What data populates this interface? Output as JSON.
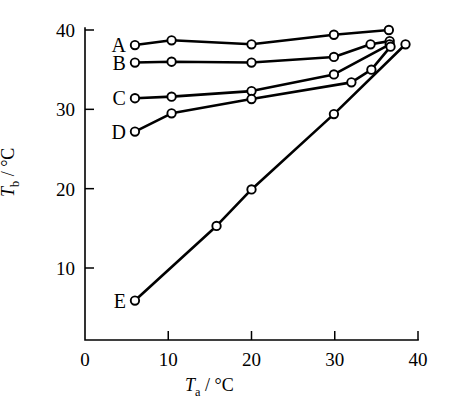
{
  "chart_data": {
    "type": "line",
    "title": "",
    "xlabel": "Ta / °C",
    "ylabel": "Tb / °C",
    "xlim": [
      0,
      40
    ],
    "ylim": [
      0,
      40
    ],
    "xticks": [
      0,
      10,
      20,
      30,
      40
    ],
    "yticks": [
      10,
      20,
      30,
      40
    ],
    "grid": false,
    "legend_position": "inline-left-labels",
    "marker": "open-circle",
    "series": [
      {
        "name": "A",
        "label": "A",
        "points": [
          [
            6.0,
            38.1
          ],
          [
            10.4,
            38.7
          ],
          [
            20.0,
            38.2
          ],
          [
            29.9,
            39.4
          ],
          [
            36.5,
            40.0
          ]
        ]
      },
      {
        "name": "B",
        "label": "B",
        "points": [
          [
            6.0,
            35.9
          ],
          [
            10.4,
            36.0
          ],
          [
            20.0,
            35.9
          ],
          [
            29.9,
            36.6
          ],
          [
            34.3,
            38.2
          ],
          [
            36.6,
            38.6
          ]
        ]
      },
      {
        "name": "C",
        "label": "C",
        "points": [
          [
            6.0,
            31.4
          ],
          [
            10.4,
            31.6
          ],
          [
            20.0,
            32.3
          ],
          [
            29.9,
            34.4
          ],
          [
            36.6,
            38.2
          ]
        ]
      },
      {
        "name": "D",
        "label": "D",
        "points": [
          [
            6.0,
            27.2
          ],
          [
            10.4,
            29.5
          ],
          [
            20.0,
            31.3
          ],
          [
            32.0,
            33.4
          ],
          [
            34.4,
            35.0
          ],
          [
            36.7,
            37.9
          ]
        ]
      },
      {
        "name": "E",
        "label": "E",
        "points": [
          [
            6.0,
            5.9
          ],
          [
            15.8,
            15.3
          ],
          [
            20.0,
            19.9
          ],
          [
            29.9,
            29.4
          ],
          [
            38.5,
            38.2
          ]
        ]
      }
    ]
  },
  "axes": {
    "x_title_main": "T",
    "x_title_sub": "a",
    "x_title_unit": " / °C",
    "y_title_main": "T",
    "y_title_sub": "b",
    "y_title_unit": " / °C",
    "xtick_labels": [
      "0",
      "10",
      "20",
      "30",
      "40"
    ],
    "ytick_labels": [
      "10",
      "20",
      "30",
      "40"
    ]
  },
  "colors": {
    "line": "#000000",
    "marker_fill": "#ffffff",
    "background": "#ffffff"
  }
}
